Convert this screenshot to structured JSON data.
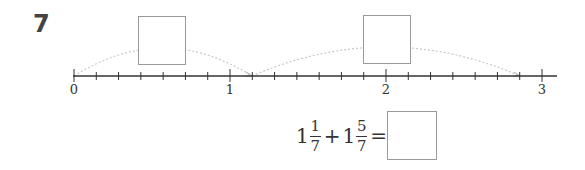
{
  "question": {
    "number": "7"
  },
  "number_line": {
    "min": 0,
    "max": 3,
    "subdivisions_per_unit": 7,
    "labels": [
      "0",
      "1",
      "2",
      "3"
    ],
    "jumps": [
      {
        "from": "0",
        "to": "1 1/7",
        "answer_box": ""
      },
      {
        "from": "1 1/7",
        "to": "2 6/7",
        "answer_box": ""
      }
    ]
  },
  "equation": {
    "term1": {
      "whole": "1",
      "numerator": "1",
      "denominator": "7"
    },
    "operator": "+",
    "term2": {
      "whole": "1",
      "numerator": "5",
      "denominator": "7"
    },
    "equals": "=",
    "answer_box": ""
  },
  "colors": {
    "axis": "#333333",
    "arc": "#c8c8c8",
    "box_border": "#9a9a9a"
  }
}
